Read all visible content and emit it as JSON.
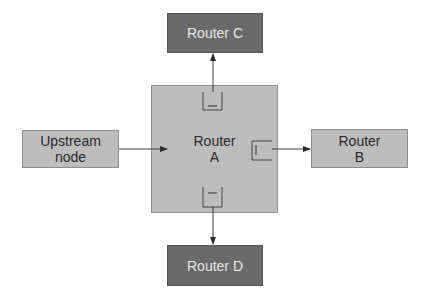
{
  "diagram": {
    "colors": {
      "light_node": "#bdbdbd",
      "dark_node": "#6a6a6a",
      "line": "#3a3a3a",
      "background": "#ffffff"
    },
    "nodes": {
      "upstream": {
        "line1": "Upstream",
        "line2": "node"
      },
      "router_a": {
        "line1": "Router",
        "line2": "A"
      },
      "router_b": {
        "line1": "Router",
        "line2": "B"
      },
      "router_c": {
        "line1": "Router C"
      },
      "router_d": {
        "line1": "Router D"
      }
    },
    "edges": [
      {
        "from": "Upstream node",
        "to": "Router A"
      },
      {
        "from": "Router A",
        "to": "Router B"
      },
      {
        "from": "Router A",
        "to": "Router C"
      },
      {
        "from": "Router A",
        "to": "Router D"
      }
    ]
  }
}
